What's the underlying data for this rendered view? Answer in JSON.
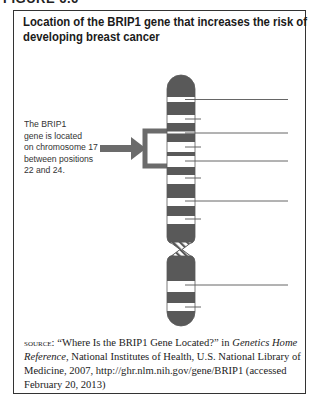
{
  "figure": {
    "label": "FIGURE 6.6",
    "title_line1": "Location of the BRIP1 gene that increases the risk of",
    "title_line2": "developing breast cancer"
  },
  "callout": {
    "text": "The BRIP1\ngene is located\non chromosome 17\nbetween positions\n22 and 24."
  },
  "chromosome": {
    "number": "17",
    "gene": "BRIP1",
    "highlight_positions": "22 and 24",
    "colors": {
      "dark_band": "#595959",
      "light_band": "#ffffff",
      "highlight_bracket": "#6b6b6b",
      "arrow": "#6b6b6b"
    }
  },
  "source": {
    "label": "Source:",
    "quote": " “Where Is the BRIP1 Gene Located?” in ",
    "publication": "Genetics Home Reference",
    "rest": ", National Institutes of Health, U.S. National Library of Medicine, 2007, http://ghr.nlm.nih.gov/gene/BRIP1 (accessed February 20, 2013)"
  }
}
